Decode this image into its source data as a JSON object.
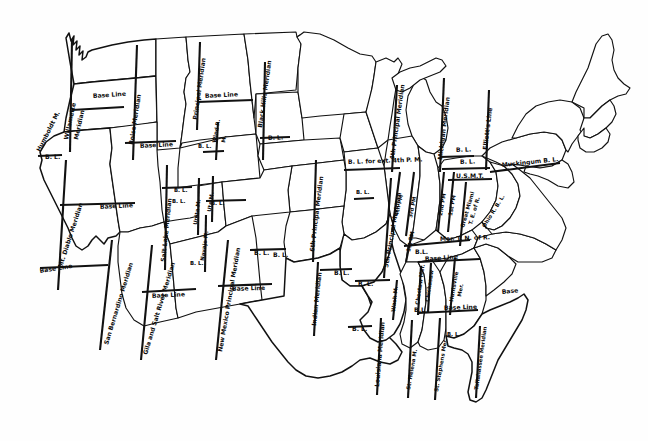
{
  "map": {
    "title": "Principal Meridians and Base Lines of the United States Public Land Survey System",
    "ink_color": "#111111",
    "paper_color": "#ffffff",
    "width": 648,
    "height": 441
  },
  "meridian_labels": [
    {
      "id": "humboldt",
      "text": "Humboldt M.",
      "x": 40,
      "y": 152,
      "rot": -63,
      "size": "lbl-sm"
    },
    {
      "id": "willamette",
      "text": "Willamette",
      "x": 68,
      "y": 140,
      "rot": -78,
      "size": "lbl-sm"
    },
    {
      "id": "willamette2",
      "text": "Meridian",
      "x": 78,
      "y": 140,
      "rot": -78,
      "size": "lbl-sm"
    },
    {
      "id": "mt-diablo",
      "text": "Mt. Diablo Meridian",
      "x": 62,
      "y": 268,
      "rot": -72,
      "size": "lbl-sm"
    },
    {
      "id": "san-bernardino",
      "text": "San Bernardino Meridian",
      "x": 108,
      "y": 345,
      "rot": -73,
      "size": "lbl-sm"
    },
    {
      "id": "gila-salt",
      "text": "Gila and Salt River Meridian",
      "x": 147,
      "y": 355,
      "rot": -73,
      "size": "lbl-sm"
    },
    {
      "id": "salt-lake",
      "text": "Salt Lake Meridian",
      "x": 165,
      "y": 262,
      "rot": -84,
      "size": "lbl-sm"
    },
    {
      "id": "boise",
      "text": "Boise Meridian",
      "x": 133,
      "y": 145,
      "rot": -81,
      "size": "lbl-sm"
    },
    {
      "id": "principal-mont",
      "text": "Principal Meridian",
      "x": 197,
      "y": 120,
      "rot": -82,
      "size": "lbl-sm"
    },
    {
      "id": "black-hills",
      "text": "Black Hills Meridian",
      "x": 262,
      "y": 128,
      "rot": -82,
      "size": "lbl-sm"
    },
    {
      "id": "wind-river",
      "text": "Wind R.",
      "x": 216,
      "y": 143,
      "rot": -80,
      "size": "lbl-xs"
    },
    {
      "id": "wind-river2",
      "text": "M.",
      "x": 225,
      "y": 143,
      "rot": -80,
      "size": "lbl-xs"
    },
    {
      "id": "uintah",
      "text": "Unita M.",
      "x": 197,
      "y": 225,
      "rot": -82,
      "size": "lbl-xs"
    },
    {
      "id": "ute",
      "text": "Ute M.",
      "x": 211,
      "y": 212,
      "rot": -82,
      "size": "lbl-xs"
    },
    {
      "id": "navajo",
      "text": "Navajo M.",
      "x": 204,
      "y": 261,
      "rot": -82,
      "size": "lbl-xs"
    },
    {
      "id": "new-mexico",
      "text": "New Mexico Principal Meridian",
      "x": 222,
      "y": 352,
      "rot": -80,
      "size": "lbl-sm"
    },
    {
      "id": "sixth-pm",
      "text": "6th Principal Meridian",
      "x": 314,
      "y": 252,
      "rot": -83,
      "size": "lbl-sm"
    },
    {
      "id": "indian",
      "text": "Indian Meridian",
      "x": 316,
      "y": 326,
      "rot": -84,
      "size": "lbl-sm"
    },
    {
      "id": "fifth-pm",
      "text": "5th Principal Meridian",
      "x": 388,
      "y": 268,
      "rot": -80,
      "size": "lbl-sm"
    },
    {
      "id": "wash-m",
      "text": "Wash M.",
      "x": 395,
      "y": 312,
      "rot": -84,
      "size": "lbl-xs"
    },
    {
      "id": "louisiana",
      "text": "Louisiana Meridian",
      "x": 379,
      "y": 387,
      "rot": -85,
      "size": "lbl-sm"
    },
    {
      "id": "st-helena",
      "text": "St. Helena M.",
      "x": 410,
      "y": 390,
      "rot": -80,
      "size": "lbl-xs"
    },
    {
      "id": "st-stephens",
      "text": "St. Stephens Mer.",
      "x": 438,
      "y": 392,
      "rot": -80,
      "size": "lbl-xs"
    },
    {
      "id": "choctaw",
      "text": "Choctaw Mer.",
      "x": 419,
      "y": 305,
      "rot": -82,
      "size": "lbl-xs"
    },
    {
      "id": "chickasaw",
      "text": "Chickasaw",
      "x": 429,
      "y": 302,
      "rot": -82,
      "size": "lbl-xs"
    },
    {
      "id": "huntsville",
      "text": "Huntsville",
      "x": 453,
      "y": 302,
      "rot": -80,
      "size": "lbl-xs"
    },
    {
      "id": "huntsville2",
      "text": "Mer.",
      "x": 461,
      "y": 297,
      "rot": -80,
      "size": "lbl-xs"
    },
    {
      "id": "tallahassee",
      "text": "Tallahassee Meridian",
      "x": 478,
      "y": 390,
      "rot": -82,
      "size": "lbl-xs"
    },
    {
      "id": "fourth-pm",
      "text": "4th Principal Meridian",
      "x": 394,
      "y": 160,
      "rot": -82,
      "size": "lbl-sm"
    },
    {
      "id": "michigan",
      "text": "Michigan Meridian",
      "x": 442,
      "y": 160,
      "rot": -83,
      "size": "lbl-sm"
    },
    {
      "id": "elliotts",
      "text": "Elliott's Line",
      "x": 487,
      "y": 150,
      "rot": -83,
      "size": "lbl-sm"
    },
    {
      "id": "fourth-pm2",
      "text": "4th PM",
      "x": 398,
      "y": 216,
      "rot": -76,
      "size": "lbl-xs"
    },
    {
      "id": "third-pm",
      "text": "3rd PM",
      "x": 412,
      "y": 218,
      "rot": -78,
      "size": "lbl-xs"
    },
    {
      "id": "second-pm",
      "text": "2nd PM",
      "x": 442,
      "y": 216,
      "rot": -80,
      "size": "lbl-xs"
    },
    {
      "id": "first-pm",
      "text": "1st PM",
      "x": 452,
      "y": 216,
      "rot": -80,
      "size": "lbl-xs"
    },
    {
      "id": "first-pm-b",
      "text": "1st PM",
      "x": 410,
      "y": 252,
      "rot": -78,
      "size": "lbl-xs"
    },
    {
      "id": "great-miami",
      "text": "Great Miami",
      "x": 464,
      "y": 228,
      "rot": -74,
      "size": "lbl-xs"
    },
    {
      "id": "great-miami2",
      "text": "T. E. of R.",
      "x": 472,
      "y": 225,
      "rot": -74,
      "size": "lbl-xs"
    },
    {
      "id": "ohio-river-bl",
      "text": "Ohio R. B. L.",
      "x": 485,
      "y": 228,
      "rot": -58,
      "size": "lbl-xs"
    }
  ],
  "baseline_labels": [
    {
      "id": "bl-oregon",
      "text": "Base Line",
      "x": 93,
      "y": 98,
      "rot": -4,
      "size": "lbl-sm"
    },
    {
      "id": "bl-idaho",
      "text": "Base Line",
      "x": 140,
      "y": 148,
      "rot": -3,
      "size": "lbl-sm"
    },
    {
      "id": "bl-montana",
      "text": "Base Line",
      "x": 205,
      "y": 98,
      "rot": -3,
      "size": "lbl-sm"
    },
    {
      "id": "bl-nevada",
      "text": "B. L.",
      "x": 45,
      "y": 159,
      "rot": 0,
      "size": "lbl-sm"
    },
    {
      "id": "bl-blackhills",
      "text": "B. L.",
      "x": 268,
      "y": 140,
      "rot": -2,
      "size": "lbl-sm"
    },
    {
      "id": "bl-wyoming",
      "text": "B. L.",
      "x": 198,
      "y": 148,
      "rot": 0,
      "size": "lbl-xs"
    },
    {
      "id": "bl-california",
      "text": "Base Line",
      "x": 100,
      "y": 209,
      "rot": -3,
      "size": "lbl-sm"
    },
    {
      "id": "bl-socal",
      "text": "Base Line",
      "x": 40,
      "y": 273,
      "rot": -9,
      "size": "lbl-sm"
    },
    {
      "id": "bl-arizona",
      "text": "Base Line",
      "x": 152,
      "y": 298,
      "rot": -3,
      "size": "lbl-sm"
    },
    {
      "id": "bl-utah",
      "text": "B. L.",
      "x": 174,
      "y": 192,
      "rot": 0,
      "size": "lbl-xs"
    },
    {
      "id": "bl-utah2",
      "text": "B. L.",
      "x": 172,
      "y": 203,
      "rot": 0,
      "size": "lbl-xs"
    },
    {
      "id": "bl-colorado",
      "text": "B. L.",
      "x": 211,
      "y": 205,
      "rot": 0,
      "size": "lbl-xs"
    },
    {
      "id": "bl-navajo",
      "text": "B. L.",
      "x": 190,
      "y": 265,
      "rot": 0,
      "size": "lbl-xs"
    },
    {
      "id": "bl-newmexico",
      "text": "Base Line",
      "x": 232,
      "y": 291,
      "rot": -2,
      "size": "lbl-sm"
    },
    {
      "id": "bl-nm2",
      "text": "B. L.",
      "x": 273,
      "y": 257,
      "rot": 0,
      "size": "lbl-sm"
    },
    {
      "id": "bl-kansas",
      "text": "B. L.",
      "x": 254,
      "y": 255,
      "rot": 0,
      "size": "lbl-sm"
    },
    {
      "id": "bl-oklahoma",
      "text": "B. L.",
      "x": 334,
      "y": 275,
      "rot": 0,
      "size": "lbl-sm"
    },
    {
      "id": "bl-arkansas",
      "text": "B. L.",
      "x": 358,
      "y": 286,
      "rot": 0,
      "size": "lbl-sm"
    },
    {
      "id": "bl-texas",
      "text": "B. L.",
      "x": 352,
      "y": 331,
      "rot": 0,
      "size": "lbl-sm"
    },
    {
      "id": "bl-ext-4th",
      "text": "B. L. for ext. 4th P. M.",
      "x": 348,
      "y": 164,
      "rot": -2,
      "size": "lbl-sm"
    },
    {
      "id": "bl-illinois",
      "text": "B. L.",
      "x": 356,
      "y": 194,
      "rot": 0,
      "size": "lbl-xs"
    },
    {
      "id": "bl-indiana",
      "text": "B. L.",
      "x": 456,
      "y": 152,
      "rot": -2,
      "size": "lbl-sm"
    },
    {
      "id": "bl-indiana2",
      "text": "B. L.",
      "x": 460,
      "y": 164,
      "rot": -2,
      "size": "lbl-sm"
    },
    {
      "id": "usmt",
      "text": "U.S.M.T.",
      "x": 456,
      "y": 178,
      "rot": 0,
      "size": "lbl-sm"
    },
    {
      "id": "muskingum",
      "text": "Muskingum B. L.",
      "x": 502,
      "y": 167,
      "rot": -6,
      "size": "lbl-sm"
    },
    {
      "id": "mer-tn-or",
      "text": "Mer. T. N. of R.",
      "x": 440,
      "y": 241,
      "rot": -2,
      "size": "lbl-sm"
    },
    {
      "id": "bl-tennessee",
      "text": "B.L.",
      "x": 415,
      "y": 254,
      "rot": 0,
      "size": "lbl-sm"
    },
    {
      "id": "bl-mississippi",
      "text": "Base Line",
      "x": 425,
      "y": 261,
      "rot": -4,
      "size": "lbl-sm"
    },
    {
      "id": "bl-ms2",
      "text": "B.L.",
      "x": 414,
      "y": 312,
      "rot": 0,
      "size": "lbl-sm"
    },
    {
      "id": "bl-alabama",
      "text": "Base Line",
      "x": 444,
      "y": 310,
      "rot": -2,
      "size": "lbl-sm"
    },
    {
      "id": "bl-alabama2",
      "text": "B. L.",
      "x": 447,
      "y": 336,
      "rot": 0,
      "size": "lbl-xs"
    },
    {
      "id": "bl-florida",
      "text": "Base",
      "x": 502,
      "y": 294,
      "rot": -6,
      "size": "lbl-sm"
    }
  ],
  "meridian_lines": [
    {
      "id": "willamette-line",
      "x1": 72,
      "y1": 40,
      "x2": 70,
      "y2": 152
    },
    {
      "id": "boise-line",
      "x1": 137,
      "y1": 45,
      "x2": 133,
      "y2": 160
    },
    {
      "id": "montana-pm-line",
      "x1": 200,
      "y1": 42,
      "x2": 197,
      "y2": 130
    },
    {
      "id": "blackhills-line",
      "x1": 265,
      "y1": 62,
      "x2": 263,
      "y2": 160
    },
    {
      "id": "windriver-line",
      "x1": 218,
      "y1": 122,
      "x2": 216,
      "y2": 160
    },
    {
      "id": "mtdiablo-line",
      "x1": 66,
      "y1": 160,
      "x2": 58,
      "y2": 290
    },
    {
      "id": "saltlake-line",
      "x1": 167,
      "y1": 165,
      "x2": 165,
      "y2": 270
    },
    {
      "id": "uintah-line",
      "x1": 199,
      "y1": 178,
      "x2": 198,
      "y2": 235
    },
    {
      "id": "ute-line",
      "x1": 213,
      "y1": 176,
      "x2": 212,
      "y2": 222
    },
    {
      "id": "navajo-line",
      "x1": 206,
      "y1": 215,
      "x2": 205,
      "y2": 272
    },
    {
      "id": "sanbern-line",
      "x1": 112,
      "y1": 240,
      "x2": 100,
      "y2": 350
    },
    {
      "id": "gila-line",
      "x1": 152,
      "y1": 245,
      "x2": 141,
      "y2": 360
    },
    {
      "id": "newmex-line",
      "x1": 228,
      "y1": 240,
      "x2": 216,
      "y2": 360
    },
    {
      "id": "sixthpm-line",
      "x1": 316,
      "y1": 160,
      "x2": 313,
      "y2": 262
    },
    {
      "id": "indian-line",
      "x1": 318,
      "y1": 262,
      "x2": 314,
      "y2": 336
    },
    {
      "id": "fifthpm-line",
      "x1": 391,
      "y1": 178,
      "x2": 384,
      "y2": 278
    },
    {
      "id": "wash-line",
      "x1": 397,
      "y1": 280,
      "x2": 393,
      "y2": 320
    },
    {
      "id": "louisiana-line",
      "x1": 381,
      "y1": 318,
      "x2": 377,
      "y2": 395
    },
    {
      "id": "sthelena-line",
      "x1": 412,
      "y1": 320,
      "x2": 408,
      "y2": 398
    },
    {
      "id": "ststephens-line",
      "x1": 440,
      "y1": 318,
      "x2": 435,
      "y2": 400
    },
    {
      "id": "choctaw-line",
      "x1": 421,
      "y1": 266,
      "x2": 418,
      "y2": 315
    },
    {
      "id": "chickasaw-line",
      "x1": 431,
      "y1": 263,
      "x2": 428,
      "y2": 312
    },
    {
      "id": "huntsville-line",
      "x1": 455,
      "y1": 258,
      "x2": 450,
      "y2": 315
    },
    {
      "id": "tallahassee-line",
      "x1": 480,
      "y1": 326,
      "x2": 476,
      "y2": 398
    },
    {
      "id": "fourthpm-line",
      "x1": 397,
      "y1": 85,
      "x2": 392,
      "y2": 172
    },
    {
      "id": "michigan-line",
      "x1": 444,
      "y1": 78,
      "x2": 440,
      "y2": 172
    },
    {
      "id": "elliotts-line",
      "x1": 489,
      "y1": 90,
      "x2": 486,
      "y2": 170
    },
    {
      "id": "fourthpm2-line",
      "x1": 400,
      "y1": 172,
      "x2": 392,
      "y2": 232
    },
    {
      "id": "thirdpm-line",
      "x1": 414,
      "y1": 172,
      "x2": 406,
      "y2": 236
    },
    {
      "id": "firstpm-b-line",
      "x1": 412,
      "y1": 232,
      "x2": 406,
      "y2": 262
    },
    {
      "id": "secondpm-line",
      "x1": 444,
      "y1": 172,
      "x2": 438,
      "y2": 232
    },
    {
      "id": "firstpm-line",
      "x1": 454,
      "y1": 172,
      "x2": 448,
      "y2": 232
    },
    {
      "id": "greatmiami-line",
      "x1": 466,
      "y1": 182,
      "x2": 460,
      "y2": 246
    }
  ],
  "baseline_lines": [
    {
      "id": "bl-or",
      "x1": 72,
      "y1": 110,
      "x2": 124,
      "y2": 107
    },
    {
      "id": "bl-id",
      "x1": 125,
      "y1": 143,
      "x2": 176,
      "y2": 141
    },
    {
      "id": "bl-mt",
      "x1": 197,
      "y1": 102,
      "x2": 253,
      "y2": 100
    },
    {
      "id": "bl-nv",
      "x1": 38,
      "y1": 156,
      "x2": 62,
      "y2": 155
    },
    {
      "id": "bl-bh",
      "x1": 260,
      "y1": 138,
      "x2": 290,
      "y2": 137
    },
    {
      "id": "bl-wy",
      "x1": 203,
      "y1": 152,
      "x2": 224,
      "y2": 151
    },
    {
      "id": "bl-ca",
      "x1": 60,
      "y1": 205,
      "x2": 135,
      "y2": 203
    },
    {
      "id": "bl-socal-l",
      "x1": 40,
      "y1": 268,
      "x2": 108,
      "y2": 265
    },
    {
      "id": "bl-az",
      "x1": 142,
      "y1": 292,
      "x2": 196,
      "y2": 289
    },
    {
      "id": "bl-ut",
      "x1": 162,
      "y1": 188,
      "x2": 192,
      "y2": 187
    },
    {
      "id": "bl-co",
      "x1": 206,
      "y1": 201,
      "x2": 246,
      "y2": 200
    },
    {
      "id": "bl-nm",
      "x1": 218,
      "y1": 286,
      "x2": 272,
      "y2": 284
    },
    {
      "id": "bl-ks",
      "x1": 250,
      "y1": 250,
      "x2": 286,
      "y2": 249
    },
    {
      "id": "bl-ok",
      "x1": 320,
      "y1": 270,
      "x2": 352,
      "y2": 269
    },
    {
      "id": "bl-ar",
      "x1": 355,
      "y1": 281,
      "x2": 390,
      "y2": 280
    },
    {
      "id": "bl-tx",
      "x1": 348,
      "y1": 327,
      "x2": 372,
      "y2": 326
    },
    {
      "id": "bl-ext4",
      "x1": 344,
      "y1": 170,
      "x2": 400,
      "y2": 168
    },
    {
      "id": "bl-il",
      "x1": 354,
      "y1": 199,
      "x2": 374,
      "y2": 198
    },
    {
      "id": "bl-in",
      "x1": 440,
      "y1": 157,
      "x2": 474,
      "y2": 156
    },
    {
      "id": "bl-in2",
      "x1": 442,
      "y1": 169,
      "x2": 490,
      "y2": 168
    },
    {
      "id": "bl-usmt",
      "x1": 448,
      "y1": 180,
      "x2": 492,
      "y2": 179
    },
    {
      "id": "bl-musk",
      "x1": 490,
      "y1": 172,
      "x2": 560,
      "y2": 163
    },
    {
      "id": "bl-tn",
      "x1": 404,
      "y1": 246,
      "x2": 470,
      "y2": 240
    },
    {
      "id": "bl-ms",
      "x1": 418,
      "y1": 262,
      "x2": 480,
      "y2": 259
    },
    {
      "id": "bl-al",
      "x1": 418,
      "y1": 313,
      "x2": 478,
      "y2": 310
    }
  ]
}
